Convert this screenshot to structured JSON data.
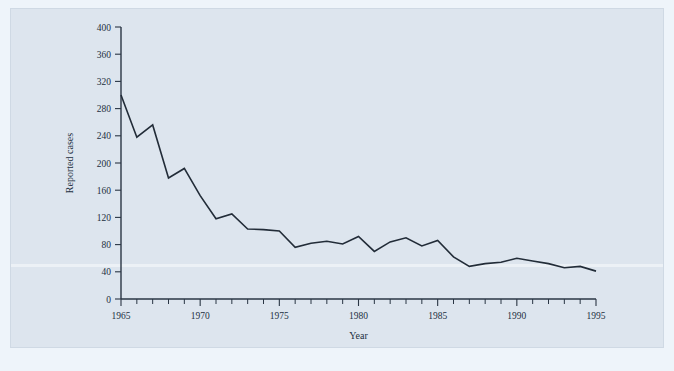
{
  "chart_data": {
    "type": "line",
    "title": "",
    "xlabel": "Year",
    "ylabel": "Reported cases",
    "xlim": [
      1965,
      1995
    ],
    "ylim": [
      0,
      400
    ],
    "grid": false,
    "legend": false,
    "x_tick_labels": [
      "1965",
      "1970",
      "1975",
      "1980",
      "1985",
      "1990",
      "1995"
    ],
    "x_tick_values": [
      1965,
      1970,
      1975,
      1980,
      1985,
      1990,
      1995
    ],
    "x_minor_tick_step": 1,
    "y_tick_labels": [
      "0",
      "40",
      "80",
      "120",
      "160",
      "200",
      "240",
      "280",
      "320",
      "360",
      "400"
    ],
    "y_tick_values": [
      0,
      40,
      80,
      120,
      160,
      200,
      240,
      280,
      320,
      360,
      400
    ],
    "x": [
      1965,
      1966,
      1967,
      1968,
      1969,
      1970,
      1971,
      1972,
      1973,
      1974,
      1975,
      1976,
      1977,
      1978,
      1979,
      1980,
      1981,
      1982,
      1983,
      1984,
      1985,
      1986,
      1987,
      1988,
      1989,
      1990,
      1991,
      1992,
      1993,
      1994,
      1995
    ],
    "values": [
      300,
      238,
      256,
      178,
      192,
      152,
      118,
      125,
      103,
      102,
      100,
      76,
      82,
      85,
      81,
      92,
      70,
      84,
      90,
      78,
      86,
      62,
      48,
      52,
      54,
      60,
      56,
      52,
      46,
      48,
      41
    ],
    "series": [
      {
        "name": "Reported cases",
        "color": "#222c38",
        "values": [
          300,
          238,
          256,
          178,
          192,
          152,
          118,
          125,
          103,
          102,
          100,
          76,
          82,
          85,
          81,
          92,
          70,
          84,
          90,
          78,
          86,
          62,
          48,
          52,
          54,
          60,
          56,
          52,
          46,
          48,
          41
        ]
      }
    ]
  },
  "figure": {
    "background_color": "#eef4fa",
    "plate_color": "#dde5ee",
    "line_color": "#222c38",
    "axis_color": "#2a3644"
  }
}
